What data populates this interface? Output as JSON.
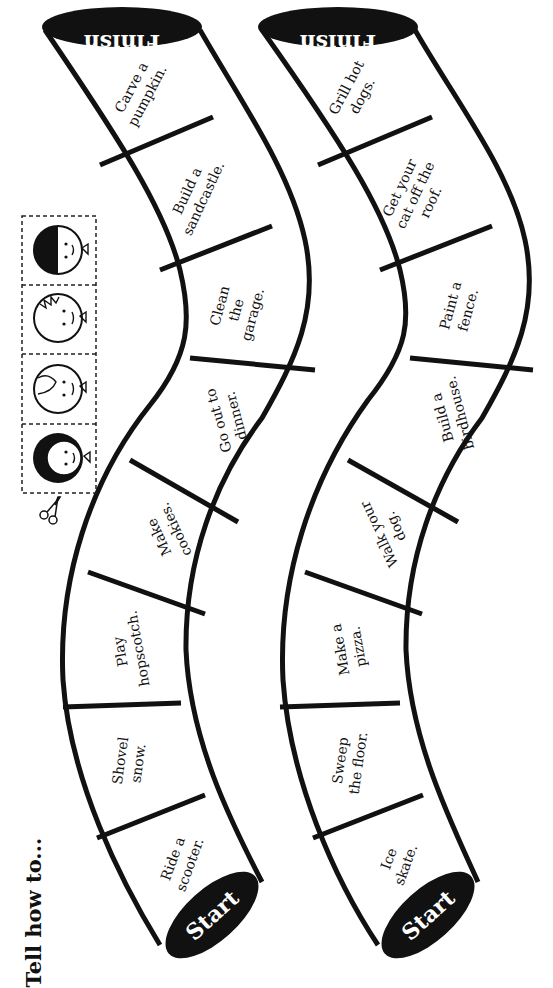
{
  "title": "Tell how to...",
  "colors": {
    "ink": "#111111",
    "paper": "#ffffff"
  },
  "boards": [
    {
      "id": "left",
      "start_label": "Start",
      "finish_label": "Finish",
      "spaces": [
        {
          "line1": "Ride a",
          "line2": "scooter."
        },
        {
          "line1": "Shovel",
          "line2": "snow."
        },
        {
          "line1": "Play",
          "line2": "hopscotch."
        },
        {
          "line1": "Make",
          "line2": "cookies."
        },
        {
          "line1": "Go out to",
          "line2": "dinner."
        },
        {
          "line1": "Clean",
          "line2": "the",
          "line3": "garage."
        },
        {
          "line1": "Build a",
          "line2": "sandcastle."
        },
        {
          "line1": "Carve a",
          "line2": "pumpkin."
        }
      ]
    },
    {
      "id": "right",
      "start_label": "Start",
      "finish_label": "Finish",
      "spaces": [
        {
          "line1": "Ice",
          "line2": "skate."
        },
        {
          "line1": "Sweep",
          "line2": "the floor."
        },
        {
          "line1": "Make a",
          "line2": "pizza."
        },
        {
          "line1": "Walk your",
          "line2": "dog."
        },
        {
          "line1": "Build a",
          "line2": "birdhouse."
        },
        {
          "line1": "Paint a",
          "line2": "fence."
        },
        {
          "line1": "Get your",
          "line2": "cat off the",
          "line3": "roof."
        },
        {
          "line1": "Grill hot",
          "line2": "dogs."
        }
      ]
    }
  ],
  "game_pieces": {
    "count": 4,
    "items": [
      "curly-haired-kid",
      "girl-with-bow",
      "spiky-haired-kid",
      "dark-haired-girl"
    ],
    "cut_icon": "scissors-icon"
  }
}
